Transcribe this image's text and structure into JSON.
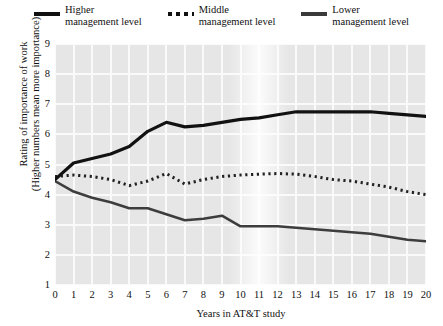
{
  "legend": {
    "entries": [
      {
        "name": "higher",
        "line1": "Higher",
        "line2": "management level",
        "style": "solid-thick",
        "color": "#111111"
      },
      {
        "name": "middle",
        "line1": "Middle",
        "line2": "management level",
        "style": "dotted",
        "color": "#222222"
      },
      {
        "name": "lower",
        "line1": "Lower",
        "line2": "management level",
        "style": "solid-med",
        "color": "#3d3d3d"
      }
    ]
  },
  "axes": {
    "ylabel_line1": "Rating of importance of work",
    "ylabel_line2": "(Higher numbers mean more importance)",
    "xlabel": "Years in AT&T study",
    "yticks": [
      "1",
      "2",
      "3",
      "4",
      "5",
      "6",
      "7",
      "8",
      "9"
    ],
    "xticks": [
      "0",
      "1",
      "2",
      "3",
      "4",
      "5",
      "6",
      "7",
      "8",
      "9",
      "10",
      "11",
      "12",
      "13",
      "14",
      "15",
      "16",
      "17",
      "18",
      "19",
      "20"
    ]
  },
  "chart_data": {
    "type": "line",
    "title": "",
    "xlabel": "Years in AT&T study",
    "ylabel": "Rating of importance of work (Higher numbers mean more importance)",
    "x": [
      0,
      1,
      2,
      3,
      4,
      5,
      6,
      7,
      8,
      9,
      10,
      11,
      12,
      13,
      14,
      15,
      16,
      17,
      18,
      19,
      20
    ],
    "xlim": [
      0,
      20
    ],
    "ylim": [
      1,
      9
    ],
    "grid": true,
    "legend_position": "top-center",
    "series": [
      {
        "name": "Higher management level",
        "style": "solid",
        "color": "#111111",
        "values": [
          4.5,
          5.05,
          5.2,
          5.35,
          5.6,
          6.1,
          6.4,
          6.25,
          6.3,
          6.4,
          6.5,
          6.55,
          6.65,
          6.75,
          6.75,
          6.75,
          6.75,
          6.75,
          6.7,
          6.65,
          6.6
        ]
      },
      {
        "name": "Middle management level",
        "style": "dotted",
        "color": "#222222",
        "values": [
          4.6,
          4.65,
          4.6,
          4.5,
          4.3,
          4.45,
          4.7,
          4.35,
          4.5,
          4.6,
          4.65,
          4.68,
          4.7,
          4.68,
          4.6,
          4.5,
          4.45,
          4.35,
          4.25,
          4.1,
          4.0
        ]
      },
      {
        "name": "Lower management level",
        "style": "solid",
        "color": "#3d3d3d",
        "values": [
          4.45,
          4.1,
          3.9,
          3.75,
          3.55,
          3.55,
          3.35,
          3.15,
          3.2,
          3.3,
          2.95,
          2.95,
          2.95,
          2.9,
          2.85,
          2.8,
          2.75,
          2.7,
          2.6,
          2.5,
          2.45
        ]
      }
    ]
  }
}
